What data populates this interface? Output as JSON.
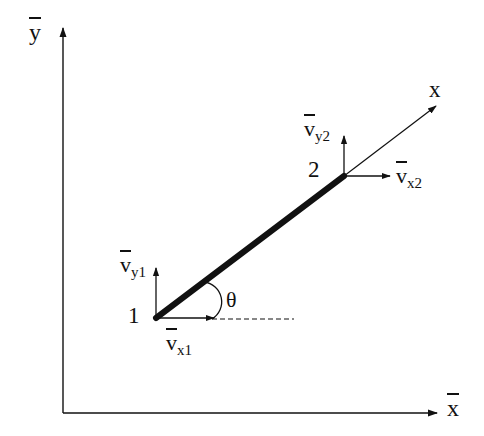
{
  "diagram": {
    "type": "beam element in global coordinates",
    "global_axes": {
      "y_label": "y",
      "x_label": "x",
      "overbar": true
    },
    "local_axis": {
      "label": "x"
    },
    "nodes": [
      {
        "id": "1",
        "label": "1",
        "vx_label": "v",
        "vx_sub": "x1",
        "vy_label": "v",
        "vy_sub": "y1"
      },
      {
        "id": "2",
        "label": "2",
        "vx_label": "v",
        "vx_sub": "x2",
        "vy_label": "v",
        "vy_sub": "y2"
      }
    ],
    "angle_label": "θ",
    "colors": {
      "line": "#111111",
      "background": "#ffffff"
    }
  }
}
